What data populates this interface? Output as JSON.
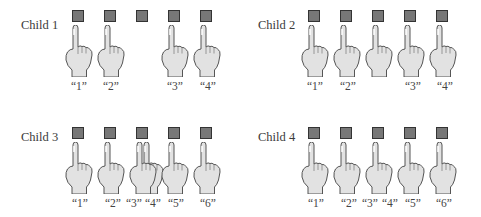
{
  "colors": {
    "square_fill": "#777777",
    "square_border": "#333333",
    "hand_fill": "#e2e2e2",
    "hand_outline": "#555555"
  },
  "panels": [
    {
      "label": "Child 1",
      "objects": 5,
      "points": [
        {
          "object_index": 0,
          "count_label": "“1”"
        },
        {
          "object_index": 1,
          "count_label": "“2”"
        },
        {
          "object_index": 3,
          "count_label": "“3”"
        },
        {
          "object_index": 4,
          "count_label": "“4”"
        }
      ],
      "error": "skipped object 3"
    },
    {
      "label": "Child 2",
      "objects": 5,
      "points": [
        {
          "object_index": 0,
          "count_label": "“1”"
        },
        {
          "object_index": 1,
          "count_label": "“2”"
        },
        {
          "object_index": 2,
          "count_label": ""
        },
        {
          "object_index": 3,
          "count_label": "“3”"
        },
        {
          "object_index": 4,
          "count_label": "“4”"
        }
      ],
      "error": "pointed without counting at object 3"
    },
    {
      "label": "Child 3",
      "objects": 5,
      "points": [
        {
          "object_index": 0,
          "count_label": "“1”"
        },
        {
          "object_index": 1,
          "count_label": "“2”"
        },
        {
          "object_index": 2,
          "count_label": "“3”"
        },
        {
          "object_index": 2,
          "count_label": "“4”"
        },
        {
          "object_index": 3,
          "count_label": "“5”"
        },
        {
          "object_index": 4,
          "count_label": "“6”"
        }
      ],
      "error": "pointed twice at object 3"
    },
    {
      "label": "Child 4",
      "objects": 5,
      "points": [
        {
          "object_index": 0,
          "count_label": "“1”"
        },
        {
          "object_index": 1,
          "count_label": "“2”"
        },
        {
          "object_index": 2,
          "count_label": "“3” “4”"
        },
        {
          "object_index": 3,
          "count_label": "“5”"
        },
        {
          "object_index": 4,
          "count_label": "“6”"
        }
      ],
      "error": "said two counts for object 3"
    }
  ],
  "labels": {
    "c1": [
      "“1”",
      "“2”",
      "“3”",
      "“4”"
    ],
    "c2": [
      "“1”",
      "“2”",
      "“3”",
      "“4”"
    ],
    "c3": [
      "“1”",
      "“2”",
      "“3”",
      "“4”",
      "“5”",
      "“6”"
    ],
    "c4": [
      "“1”",
      "“2”",
      "“3”",
      "“4”",
      "“5”",
      "“6”"
    ]
  }
}
